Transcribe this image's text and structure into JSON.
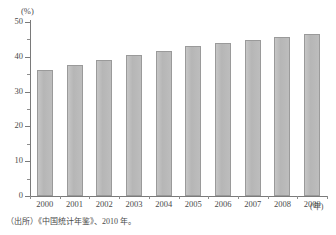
{
  "chart_data": {
    "type": "bar",
    "title": "",
    "subtitle": "",
    "xlabel": "(年)",
    "ylabel": "(%)",
    "categories": [
      "2000",
      "2001",
      "2002",
      "2003",
      "2004",
      "2005",
      "2006",
      "2007",
      "2008",
      "2009"
    ],
    "values": [
      36.2,
      37.7,
      39.1,
      40.5,
      41.8,
      43.0,
      43.9,
      44.9,
      45.7,
      46.6
    ],
    "series": [
      {
        "name": "",
        "values": [
          36.2,
          37.7,
          39.1,
          40.5,
          41.8,
          43.0,
          43.9,
          44.9,
          45.7,
          46.6
        ]
      }
    ],
    "ylim": [
      0,
      50
    ],
    "ytick_labels": [
      "0",
      "10",
      "20",
      "30",
      "40",
      "50"
    ],
    "ytick_values": [
      0,
      10,
      20,
      30,
      40,
      50
    ],
    "yminor_step": 5,
    "grid": false,
    "legend": "none",
    "bar_color": "#bcbcbc",
    "bar_border_color": "#9a9a9a",
    "axis_color": "#7a7a7a"
  },
  "axis": {
    "y_unit": "(%)",
    "x_unit": "(年)"
  },
  "source": {
    "text": "（出所）《中国统计年鉴》、2010 年。"
  }
}
